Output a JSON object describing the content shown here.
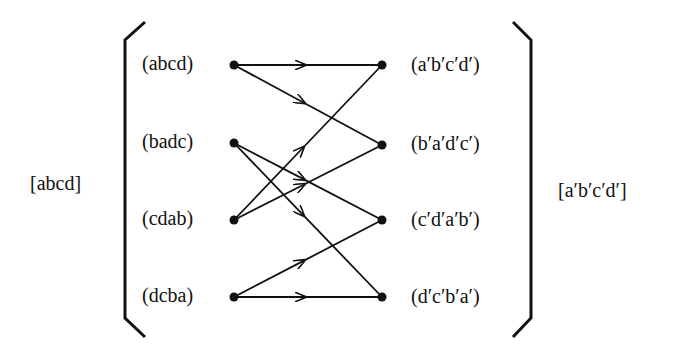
{
  "outer_left_label": "[abcd]",
  "outer_right_label": "[a′b′c′d′]",
  "left_nodes": [
    {
      "label": "(abcd)",
      "y": 65
    },
    {
      "label": "(badc)",
      "y": 143
    },
    {
      "label": "(cdab)",
      "y": 220
    },
    {
      "label": "(dcba)",
      "y": 297
    }
  ],
  "right_nodes": [
    {
      "label": "(a′b′c′d′)",
      "y": 65
    },
    {
      "label": "(b′a′d′c′)",
      "y": 145
    },
    {
      "label": "(c′d′a′b′)",
      "y": 220
    },
    {
      "label": "(d′c′b′a′)",
      "y": 297
    }
  ],
  "edges": [
    {
      "from": "(abcd)",
      "to": "(a′b′c′d′)"
    },
    {
      "from": "(abcd)",
      "to": "(b′a′d′c′)"
    },
    {
      "from": "(badc)",
      "to": "(c′d′a′b′)"
    },
    {
      "from": "(badc)",
      "to": "(d′c′b′a′)"
    },
    {
      "from": "(cdab)",
      "to": "(a′b′c′d′)"
    },
    {
      "from": "(cdab)",
      "to": "(b′a′d′c′)"
    },
    {
      "from": "(dcba)",
      "to": "(c′d′a′b′)"
    },
    {
      "from": "(dcba)",
      "to": "(d′c′b′a′)"
    }
  ]
}
